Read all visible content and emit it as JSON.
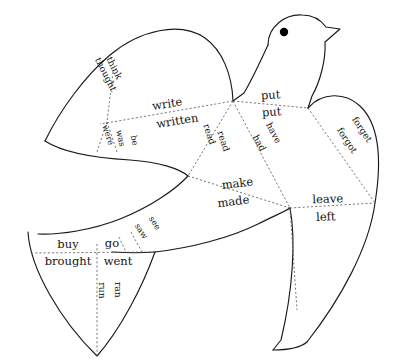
{
  "diagram": {
    "shape": "bird",
    "line_colors": {
      "outline": "#1a1a1a",
      "fold": "#555555",
      "eye": "#000000",
      "background": "#ffffff"
    },
    "eye": {
      "label": "eye-dot"
    }
  },
  "verbs": [
    {
      "id": "think",
      "base": "think",
      "past": "thought"
    },
    {
      "id": "write",
      "base": "write",
      "past": "written"
    },
    {
      "id": "be",
      "base": "be",
      "past": "was",
      "past2": "were"
    },
    {
      "id": "read",
      "base": "read",
      "past": "read"
    },
    {
      "id": "put",
      "base": "put",
      "past": "put"
    },
    {
      "id": "have",
      "base": "have",
      "past": "had"
    },
    {
      "id": "forget",
      "base": "forget",
      "past": "forgot"
    },
    {
      "id": "make",
      "base": "make",
      "past": "made"
    },
    {
      "id": "leave",
      "base": "leave",
      "past": "left"
    },
    {
      "id": "see",
      "base": "see",
      "past": "saw"
    },
    {
      "id": "buy",
      "base": "buy",
      "past": "brought"
    },
    {
      "id": "go",
      "base": "go",
      "past": "went"
    },
    {
      "id": "run",
      "base": "run",
      "past": "ran"
    }
  ],
  "labels": {
    "think": "think",
    "thought": "thought",
    "write": "write",
    "written": "written",
    "be": "be",
    "was": "was",
    "were": "were",
    "read_base": "read",
    "read_past": "read",
    "put_base": "put",
    "put_past": "put",
    "have": "have",
    "had": "had",
    "forget": "forget",
    "forgot": "forgot",
    "make": "make",
    "made": "made",
    "leave": "leave",
    "left": "left",
    "see": "see",
    "saw": "saw",
    "buy": "buy",
    "brought": "brought",
    "go": "go",
    "went": "went",
    "run": "run",
    "ran": "ran"
  }
}
